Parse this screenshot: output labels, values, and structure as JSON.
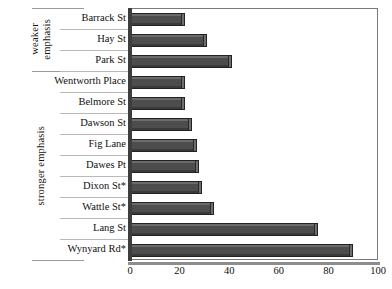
{
  "chart_data": {
    "type": "bar",
    "orientation": "horizontal",
    "title": "",
    "xlabel": "",
    "ylabel": "",
    "xlim": [
      0,
      100
    ],
    "xticks": [
      0,
      20,
      40,
      60,
      80,
      100
    ],
    "grid": false,
    "legend": "none",
    "bar_color": "#4d4d4d",
    "categories": [
      "Barrack St",
      "Hay St",
      "Park St",
      "Wentworth Place",
      "Belmore St",
      "Dawson St",
      "Fig Lane",
      "Dawes Pt",
      "Dixon St*",
      "Wattle St*",
      "Lang St",
      "Wynyard Rd*"
    ],
    "values": [
      22,
      31,
      41,
      22,
      22,
      25,
      27,
      28,
      29,
      34,
      76,
      90
    ],
    "groups": [
      {
        "label": "weaker\nemphasis",
        "categories": [
          "Barrack St",
          "Hay St",
          "Park St"
        ]
      },
      {
        "label": "stronger emphasis",
        "categories": [
          "Wentworth Place",
          "Belmore St",
          "Dawson St",
          "Fig Lane",
          "Dawes Pt",
          "Dixon St*",
          "Wattle St*",
          "Lang St",
          "Wynyard Rd*"
        ]
      }
    ]
  },
  "axis": {
    "x_tick_labels": [
      "0",
      "20",
      "40",
      "60",
      "80",
      "100"
    ]
  },
  "group_labels": {
    "weaker": "weaker\nemphasis",
    "stronger": "stronger emphasis"
  }
}
